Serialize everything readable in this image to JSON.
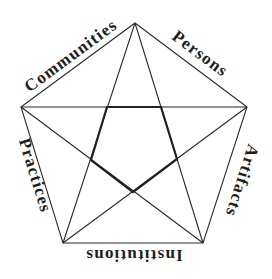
{
  "diagram": {
    "type": "pentagram-in-pentagon",
    "labels": {
      "communities": "Communities",
      "persons": "Persons",
      "artifacts": "Artifacts",
      "institutions": "Institutions",
      "practices": "Practices"
    },
    "colors": {
      "line": "#2a2a2a",
      "text": "#1e1e1e",
      "background": "#ffffff"
    }
  }
}
